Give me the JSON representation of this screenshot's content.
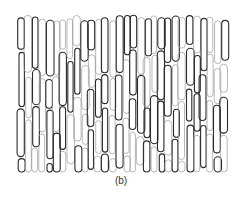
{
  "figure": {
    "caption": "(b)",
    "stroke_dark": "#2a2a2a",
    "stroke_light": "#9a9a9a"
  }
}
